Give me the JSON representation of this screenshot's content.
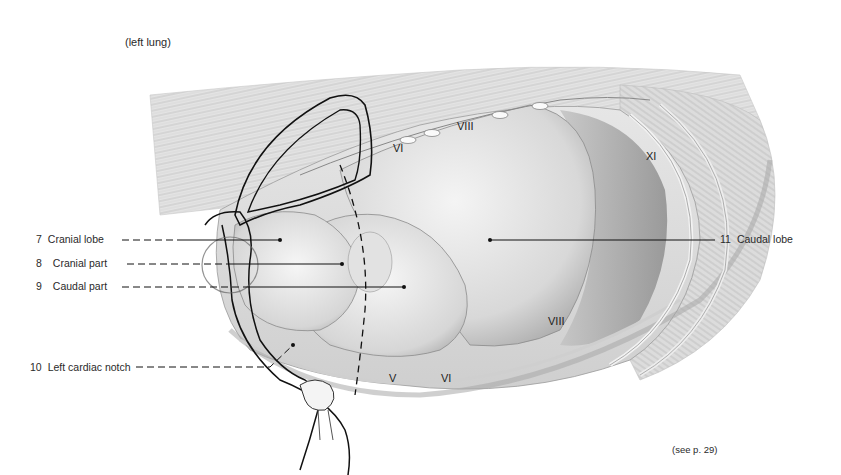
{
  "figure": {
    "caption_top": "(left lung)",
    "caption_bottom": "(see p. 29)",
    "labels": [
      {
        "number": "7",
        "text": "Cranial lobe",
        "side": "left"
      },
      {
        "number": "8",
        "text": "Cranial part",
        "side": "left"
      },
      {
        "number": "9",
        "text": "Caudal part",
        "side": "left"
      },
      {
        "number": "10",
        "text": "Left cardiac notch",
        "side": "left"
      },
      {
        "number": "11",
        "text": "Caudal lobe",
        "side": "right"
      }
    ],
    "rib_labels": [
      "VI",
      "VIII",
      "XI",
      "VIII",
      "V",
      "VI"
    ]
  }
}
